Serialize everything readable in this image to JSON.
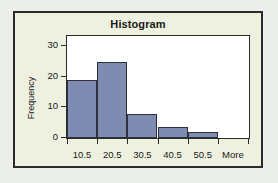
{
  "chart_data": {
    "type": "bar",
    "title": "Histogram",
    "xlabel": "",
    "ylabel": "Frequency",
    "categories": [
      "10.5",
      "20.5",
      "30.5",
      "40.5",
      "50.5",
      "More"
    ],
    "values": [
      19,
      25,
      8,
      3.5,
      2,
      0
    ],
    "ylim": [
      0,
      33
    ],
    "yticks": [
      0,
      10,
      20,
      30
    ],
    "ytick_labels": [
      "0",
      "10",
      "20",
      "30"
    ],
    "grid": false,
    "legend": false,
    "colors": {
      "bar_fill": "#7f8cb2",
      "bar_border": "#2f2f3f",
      "plot_background": "#ffffff",
      "card_background": "#eef0e0",
      "page_background": "#eceeec",
      "frame": "#2b2b2b",
      "text": "#1a1a1a"
    }
  }
}
